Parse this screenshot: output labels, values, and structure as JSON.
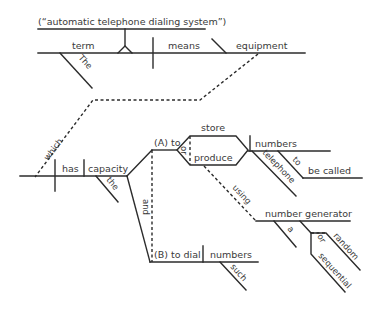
{
  "diagram": {
    "type": "Reed-Kellogg sentence diagram",
    "background": "#ffffff",
    "line_color": "#2b2b2b",
    "appositive": "(“automatic telephone dialing system”)",
    "main_clause": {
      "subject": "term",
      "subject_modifier": "The",
      "verb": "means",
      "object": "equipment"
    },
    "relative_clause": {
      "connector": "which",
      "verb": "has",
      "object": "capacity",
      "object_modifier": "the",
      "conjunction": "and",
      "branch_a": {
        "label": "(A) to",
        "conjunction": "or",
        "verbs": [
          "store",
          "produce"
        ],
        "object": "numbers",
        "object_modifier": "telephone",
        "infinitive_marker": "to",
        "infinitive": "be called",
        "preposition": "using",
        "prep_object": "number generator",
        "prep_object_article": "a",
        "prep_object_conjunction": "or",
        "prep_object_modifiers": [
          "random",
          "sequential"
        ]
      },
      "branch_b": {
        "label": "(B) to dial",
        "object": "numbers",
        "object_modifier": "such"
      }
    }
  }
}
